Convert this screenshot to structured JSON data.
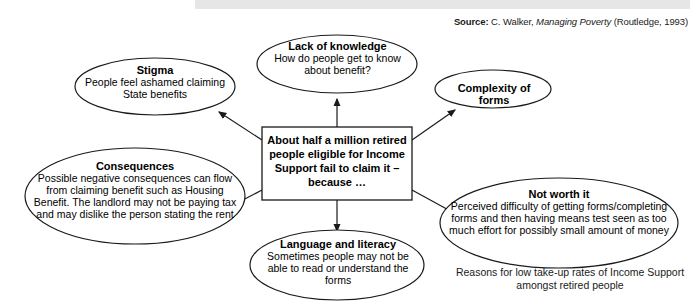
{
  "source": {
    "label": "Source:",
    "author": "C. Walker,",
    "title": "Managing Poverty",
    "publisher": "(Routledge, 1993)"
  },
  "central": {
    "text": "About half a million retired people eligible for Income Support fail to claim it – because …"
  },
  "nodes": {
    "stigma": {
      "title": "Stigma",
      "body": "People feel ashamed claiming State benefits"
    },
    "lack_of_knowledge": {
      "title": "Lack of knowledge",
      "body": "How do people get to know about benefit?"
    },
    "complexity": {
      "title": "Complexity of forms",
      "body": ""
    },
    "consequences": {
      "title": "Consequences",
      "body": "Possible negative consequences can flow from claiming benefit such as Housing Benefit. The landlord may not be paying tax and may dislike the person stating the rent"
    },
    "language": {
      "title": "Language and literacy",
      "body": "Sometimes people may not be able to read or understand the forms"
    },
    "not_worth_it": {
      "title": "Not worth it",
      "body": "Perceived difficulty of getting forms/completing forms and then having means test seen as too much effort for possibly small amount of money"
    }
  },
  "caption": {
    "text": "Reasons for low take-up rates of Income Support amongst retired people"
  },
  "colors": {
    "stroke": "#1a1a1a",
    "background": "#ffffff",
    "band": "#e6e6e6",
    "text": "#000000"
  }
}
